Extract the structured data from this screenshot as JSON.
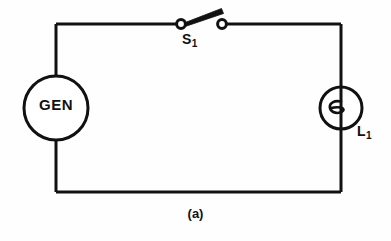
{
  "figure": {
    "caption": "(a)",
    "background_color": "#fefefe",
    "line_color": "#111111",
    "width": 391,
    "height": 241
  },
  "components": {
    "generator": {
      "label": "GEN",
      "symbol": "circle-source",
      "center_x": 56,
      "center_y": 108,
      "radius": 32
    },
    "switch": {
      "label": "S",
      "subscript": "1",
      "symbol": "spst-switch-open",
      "state": "open",
      "left_terminal_x": 181,
      "right_terminal_x": 222,
      "terminal_y": 24
    },
    "lamp": {
      "label": "L",
      "subscript": "1",
      "symbol": "lamp-filament",
      "center_x": 341,
      "center_y": 108,
      "radius": 21
    }
  },
  "wires": {
    "left_x": 56,
    "right_x": 341,
    "top_y": 24,
    "bottom_y": 192,
    "stroke_width": 3
  }
}
